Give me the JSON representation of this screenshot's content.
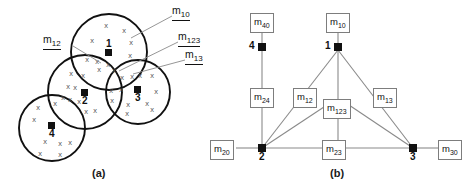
{
  "figure": {
    "panels": [
      {
        "id": "a",
        "caption": "(a)",
        "type": "overlapping-clusters-venn",
        "clusters": [
          {
            "id": "1",
            "label": "1",
            "cx": 109,
            "cy": 52,
            "r": 38
          },
          {
            "id": "2",
            "label": "2",
            "cx": 85,
            "cy": 92,
            "r": 37
          },
          {
            "id": "3",
            "label": "3",
            "cx": 138,
            "cy": 92,
            "r": 32
          },
          {
            "id": "4",
            "label": "4",
            "cx": 52,
            "cy": 128,
            "r": 33
          }
        ],
        "region_labels": [
          {
            "name": "m10",
            "text": "m",
            "sub": "10"
          },
          {
            "name": "m12",
            "text": "m",
            "sub": "12"
          },
          {
            "name": "m123",
            "text": "m",
            "sub": "123"
          },
          {
            "name": "m13",
            "text": "m",
            "sub": "13"
          }
        ],
        "data_point_glyph": "x"
      },
      {
        "id": "b",
        "caption": "(b)",
        "type": "junction-graph",
        "nodes": [
          {
            "id": "4",
            "label": "4",
            "x": 262,
            "y": 47
          },
          {
            "id": "1",
            "label": "1",
            "x": 338,
            "y": 47
          },
          {
            "id": "2",
            "label": "2",
            "x": 262,
            "y": 148
          },
          {
            "id": "3",
            "label": "3",
            "x": 413,
            "y": 148
          }
        ],
        "edge_labels": [
          {
            "name": "m40",
            "text": "m",
            "sub": "40"
          },
          {
            "name": "m10",
            "text": "m",
            "sub": "10"
          },
          {
            "name": "m24",
            "text": "m",
            "sub": "24"
          },
          {
            "name": "m12",
            "text": "m",
            "sub": "12"
          },
          {
            "name": "m123",
            "text": "m",
            "sub": "123"
          },
          {
            "name": "m13",
            "text": "m",
            "sub": "13"
          },
          {
            "name": "m20",
            "text": "m",
            "sub": "20"
          },
          {
            "name": "m23",
            "text": "m",
            "sub": "23"
          },
          {
            "name": "m30",
            "text": "m",
            "sub": "30"
          }
        ],
        "edges": [
          {
            "from": "4",
            "to": "2",
            "label": "m24"
          },
          {
            "from": "1",
            "to": "2",
            "label": "m12"
          },
          {
            "from": "1",
            "to": "3",
            "label": "m13"
          },
          {
            "from": "1",
            "to": "m123",
            "label": "m123"
          },
          {
            "from": "2",
            "to": "3",
            "label": "m23"
          },
          {
            "from": "m123",
            "to": "2",
            "label": "m123"
          },
          {
            "from": "m123",
            "to": "3",
            "label": "m123"
          }
        ]
      }
    ]
  },
  "colors": {
    "stroke": "#111111",
    "box_border": "#7d7d7d",
    "edge_line": "#8a8a8a",
    "background": "#ffffff"
  }
}
